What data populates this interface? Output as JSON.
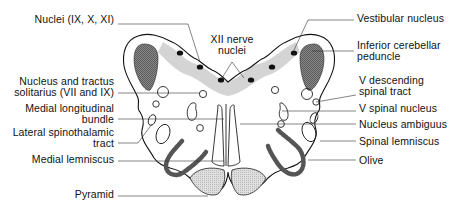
{
  "diagram": {
    "colors": {
      "outline": "#111111",
      "shading_dark": "#6e6e6e",
      "shading_light": "#d2d2d2",
      "olive": "#555555",
      "background": "#ffffff"
    },
    "labels_left": [
      {
        "id": "nuclei-ix-x-xi",
        "lines": [
          "Nuclei (IX, X, XI)"
        ]
      },
      {
        "id": "nucleus-tractus-solitarius",
        "lines": [
          "Nucleus and tractus",
          "solitarius (VII and IX)"
        ]
      },
      {
        "id": "medial-longitudinal-bundle",
        "lines": [
          "Medial longitudinal",
          "bundle"
        ]
      },
      {
        "id": "lateral-spinothalamic-tract",
        "lines": [
          "Lateral spinothalamic",
          "tract"
        ]
      },
      {
        "id": "medial-lemniscus",
        "lines": [
          "Medial lemniscus"
        ]
      },
      {
        "id": "pyramid",
        "lines": [
          "Pyramid"
        ]
      }
    ],
    "labels_center": [
      {
        "id": "xii-nerve-nuclei",
        "lines": [
          "XII nerve",
          "nuclei"
        ]
      }
    ],
    "labels_right": [
      {
        "id": "vestibular-nucleus",
        "lines": [
          "Vestibular nucleus"
        ]
      },
      {
        "id": "inferior-cerebellar-peduncle",
        "lines": [
          "Inferior cerebellar",
          "peduncle"
        ]
      },
      {
        "id": "v-descending-spinal-tract",
        "lines": [
          "V descending",
          "spinal tract"
        ]
      },
      {
        "id": "v-spinal-nucleus",
        "lines": [
          "V spinal nucleus"
        ]
      },
      {
        "id": "nucleus-ambiguus",
        "lines": [
          "Nucleus ambiguus"
        ]
      },
      {
        "id": "spinal-lemniscus",
        "lines": [
          "Spinal lemniscus"
        ]
      },
      {
        "id": "olive",
        "lines": [
          "Olive"
        ]
      }
    ]
  }
}
